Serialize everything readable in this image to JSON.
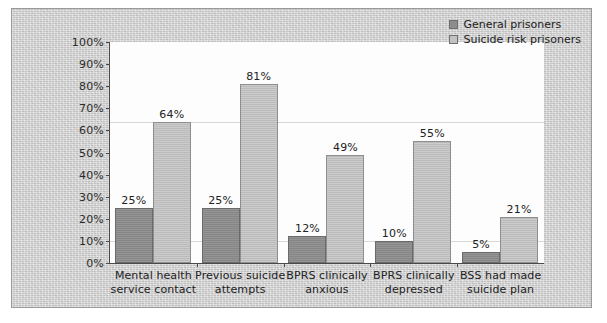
{
  "figure": {
    "background_color": "#d2d2d2",
    "plot_background_color": "#fdfdfd",
    "border_color": "#9a9a9a"
  },
  "legend": {
    "position": "top-right",
    "entries": [
      {
        "label": "General prisoners",
        "color": "#8d8d8d",
        "swatch_name": "legend-swatch-general"
      },
      {
        "label": "Suicide risk prisoners",
        "color": "#c2c2c2",
        "swatch_name": "legend-swatch-risk"
      }
    ]
  },
  "yaxis": {
    "ticks": [
      "0%",
      "10%",
      "20%",
      "30%",
      "40%",
      "50%",
      "60%",
      "70%",
      "80%",
      "90%",
      "100%"
    ]
  },
  "chart_data": {
    "type": "bar",
    "title": "",
    "subtitle": "",
    "xlabel": "",
    "ylabel": "",
    "ylim": [
      0,
      100
    ],
    "yticks": [
      0,
      10,
      20,
      30,
      40,
      50,
      60,
      70,
      80,
      90,
      100
    ],
    "ytick_labels": [
      "0%",
      "10%",
      "20%",
      "30%",
      "40%",
      "50%",
      "60%",
      "70%",
      "80%",
      "90%",
      "100%"
    ],
    "grid": false,
    "legend_position": "top-right",
    "units": "percent",
    "categories": [
      "Mental health service contact",
      "Previous suicide attempts",
      "BPRS clinically anxious",
      "BPRS clinically depressed",
      "BSS had made suicide plan"
    ],
    "category_lines": [
      [
        "Mental health",
        "service contact"
      ],
      [
        "Previous suicide",
        "attempts"
      ],
      [
        "BPRS clinically",
        "anxious"
      ],
      [
        "BPRS clinically",
        "depressed"
      ],
      [
        "BSS had made",
        "suicide plan"
      ]
    ],
    "series": [
      {
        "name": "General prisoners",
        "color": "#8d8d8d",
        "values": [
          25,
          25,
          12,
          10,
          5
        ],
        "labels": [
          "25%",
          "25%",
          "12%",
          "10%",
          "5%"
        ]
      },
      {
        "name": "Suicide risk prisoners",
        "color": "#c2c2c2",
        "values": [
          64,
          81,
          49,
          55,
          21
        ],
        "labels": [
          "64%",
          "81%",
          "49%",
          "55%",
          "21%"
        ]
      }
    ]
  }
}
